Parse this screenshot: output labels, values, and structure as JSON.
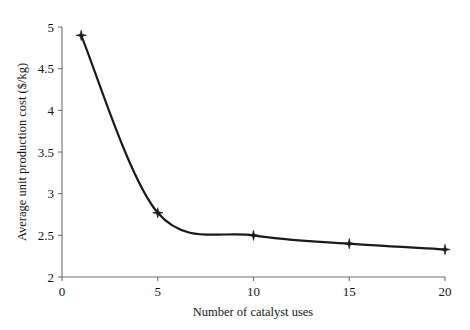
{
  "chart_data": {
    "type": "line",
    "title": "",
    "xlabel": "Number of catalyst uses",
    "ylabel": "Average unit production cost ($/kg)",
    "x": [
      1,
      5,
      10,
      15,
      20
    ],
    "values": [
      4.9,
      2.77,
      2.5,
      2.4,
      2.33
    ],
    "series": [
      {
        "name": "Average unit production cost",
        "x": [
          1,
          5,
          10,
          15,
          20
        ],
        "values": [
          4.9,
          2.77,
          2.5,
          2.4,
          2.33
        ]
      }
    ],
    "xlim": [
      0,
      20
    ],
    "ylim": [
      2,
      5
    ],
    "xticks": [
      0,
      5,
      10,
      15,
      20
    ],
    "yticks": [
      2,
      2.5,
      3,
      3.5,
      4,
      4.5,
      5
    ],
    "xtick_labels": [
      "0",
      "5",
      "10",
      "15",
      "20"
    ],
    "ytick_labels": [
      "2",
      "2.5",
      "3",
      "3.5",
      "4",
      "4.5",
      "5"
    ],
    "grid": false,
    "legend": null,
    "legend_position": "none",
    "marker": "diamond-star",
    "line_color": "#1a1a1a",
    "marker_color": "#1a1a1a",
    "axis_color": "#6e6e6e",
    "background_color": "#ffffff",
    "annotations": []
  },
  "figure": {
    "caption": ""
  }
}
